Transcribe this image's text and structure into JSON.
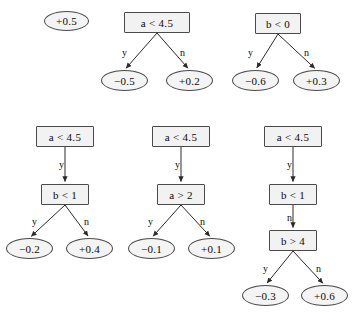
{
  "figure": {
    "kind": "decision-tree-ensemble-diagram",
    "background_color": "#ffffff",
    "node_fill": "#f2f2f2",
    "node_stroke": "#4a4a4a",
    "text_color": "#0a0a0a",
    "edge_yes_label": "y",
    "edge_no_label": "n"
  },
  "trees": [
    {
      "id": "tree-0",
      "nodes": [
        {
          "id": "t0-leaf",
          "kind": "leaf",
          "label": "+0.5",
          "x": 44,
          "y": 11,
          "w": 45,
          "h": 20
        }
      ],
      "edges": []
    },
    {
      "id": "tree-1",
      "nodes": [
        {
          "id": "t1-root",
          "kind": "split",
          "label": "a < 4.5",
          "x": 124,
          "y": 12,
          "w": 66,
          "h": 21
        },
        {
          "id": "t1-left",
          "kind": "leaf",
          "label": "−0.5",
          "x": 101,
          "y": 70,
          "w": 47,
          "h": 21
        },
        {
          "id": "t1-right",
          "kind": "leaf",
          "label": "+0.2",
          "x": 166,
          "y": 70,
          "w": 47,
          "h": 21
        }
      ],
      "edges": [
        {
          "from": "t1-root",
          "to": "t1-left",
          "label": "y",
          "label_x": 122,
          "label_y": 48
        },
        {
          "from": "t1-root",
          "to": "t1-right",
          "label": "n",
          "label_x": 180,
          "label_y": 48
        }
      ]
    },
    {
      "id": "tree-2",
      "nodes": [
        {
          "id": "t2-root",
          "kind": "split",
          "label": "b < 0",
          "x": 255,
          "y": 13,
          "w": 46,
          "h": 21
        },
        {
          "id": "t2-left",
          "kind": "leaf",
          "label": "−0.6",
          "x": 232,
          "y": 70,
          "w": 47,
          "h": 21
        },
        {
          "id": "t2-right",
          "kind": "leaf",
          "label": "+0.3",
          "x": 293,
          "y": 70,
          "w": 47,
          "h": 21
        }
      ],
      "edges": [
        {
          "from": "t2-root",
          "to": "t2-left",
          "label": "y",
          "label_x": 248,
          "label_y": 48
        },
        {
          "from": "t2-root",
          "to": "t2-right",
          "label": "n",
          "label_x": 304,
          "label_y": 48
        }
      ]
    },
    {
      "id": "tree-3",
      "nodes": [
        {
          "id": "t3-root",
          "kind": "split",
          "label": "a < 4.5",
          "x": 36,
          "y": 126,
          "w": 58,
          "h": 21
        },
        {
          "id": "t3-mid",
          "kind": "split",
          "label": "b < 1",
          "x": 41,
          "y": 184,
          "w": 48,
          "h": 21
        },
        {
          "id": "t3-left",
          "kind": "leaf",
          "label": "−0.2",
          "x": 6,
          "y": 238,
          "w": 47,
          "h": 21
        },
        {
          "id": "t3-right",
          "kind": "leaf",
          "label": "+0.4",
          "x": 66,
          "y": 238,
          "w": 47,
          "h": 21
        }
      ],
      "edges": [
        {
          "from": "t3-root",
          "to": "t3-mid",
          "label": "y",
          "label_x": 59,
          "label_y": 160
        },
        {
          "from": "t3-mid",
          "to": "t3-left",
          "label": "y",
          "label_x": 32,
          "label_y": 217
        },
        {
          "from": "t3-mid",
          "to": "t3-right",
          "label": "n",
          "label_x": 84,
          "label_y": 217
        }
      ]
    },
    {
      "id": "tree-4",
      "nodes": [
        {
          "id": "t4-root",
          "kind": "split",
          "label": "a < 4.5",
          "x": 152,
          "y": 126,
          "w": 58,
          "h": 21
        },
        {
          "id": "t4-mid",
          "kind": "split",
          "label": "a > 2",
          "x": 157,
          "y": 184,
          "w": 48,
          "h": 21
        },
        {
          "id": "t4-left",
          "kind": "leaf",
          "label": "−0.1",
          "x": 128,
          "y": 238,
          "w": 47,
          "h": 21
        },
        {
          "id": "t4-right",
          "kind": "leaf",
          "label": "+0.1",
          "x": 188,
          "y": 238,
          "w": 47,
          "h": 21
        }
      ],
      "edges": [
        {
          "from": "t4-root",
          "to": "t4-mid",
          "label": "y",
          "label_x": 175,
          "label_y": 160
        },
        {
          "from": "t4-mid",
          "to": "t4-left",
          "label": "y",
          "label_x": 148,
          "label_y": 217
        },
        {
          "from": "t4-mid",
          "to": "t4-right",
          "label": "n",
          "label_x": 200,
          "label_y": 217
        }
      ]
    },
    {
      "id": "tree-5",
      "nodes": [
        {
          "id": "t5-root",
          "kind": "split",
          "label": "a < 4.5",
          "x": 264,
          "y": 126,
          "w": 58,
          "h": 21
        },
        {
          "id": "t5-mid",
          "kind": "split",
          "label": "b < 1",
          "x": 269,
          "y": 184,
          "w": 48,
          "h": 21
        },
        {
          "id": "t5-low",
          "kind": "split",
          "label": "b > 4",
          "x": 269,
          "y": 230,
          "w": 48,
          "h": 21
        },
        {
          "id": "t5-left",
          "kind": "leaf",
          "label": "−0.3",
          "x": 242,
          "y": 285,
          "w": 47,
          "h": 21
        },
        {
          "id": "t5-right",
          "kind": "leaf",
          "label": "+0.6",
          "x": 301,
          "y": 285,
          "w": 47,
          "h": 21
        }
      ],
      "edges": [
        {
          "from": "t5-root",
          "to": "t5-mid",
          "label": "y",
          "label_x": 287,
          "label_y": 160
        },
        {
          "from": "t5-mid",
          "to": "t5-low",
          "label": "n",
          "label_x": 287,
          "label_y": 213
        },
        {
          "from": "t5-low",
          "to": "t5-left",
          "label": "y",
          "label_x": 263,
          "label_y": 264
        },
        {
          "from": "t5-low",
          "to": "t5-right",
          "label": "n",
          "label_x": 316,
          "label_y": 264
        }
      ]
    }
  ]
}
